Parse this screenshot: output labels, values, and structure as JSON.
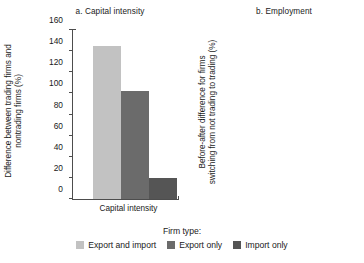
{
  "figure": {
    "legend_title": "Firm type:",
    "series_colors": {
      "export_and_import": "#c2c2c2",
      "export_only": "#6b6b6b",
      "import_only": "#555555"
    }
  },
  "chart_data": [
    {
      "type": "bar",
      "title": "a. Capital intensity",
      "categories": [
        "Capital intensity"
      ],
      "xlabel": "Capital intensity",
      "ylabel": "Difference between trading firms and nontrading firms (%)",
      "ylabel_line1": "Difference between trading firms and",
      "ylabel_line2": "nontrading firms (%)",
      "ylim": [
        0,
        160
      ],
      "yticks": [
        0,
        20,
        40,
        60,
        80,
        100,
        120,
        140,
        160
      ],
      "ytick_labels": [
        "0",
        "20",
        "40",
        "60",
        "80",
        "100",
        "120",
        "140",
        "160"
      ],
      "grid": false,
      "legend_position": "bottom",
      "series": [
        {
          "name": "Export and import",
          "values": [
            145
          ]
        },
        {
          "name": "Export only",
          "values": [
            102
          ]
        },
        {
          "name": "Import only",
          "values": [
            20
          ]
        }
      ]
    },
    {
      "type": "bar",
      "title": "b. Employment",
      "categories": [
        "Employment"
      ],
      "xlabel": "Employment",
      "ylabel": "Before-after difference for firms switching from not trading to trading (%)",
      "ylabel_line1": "Before-after difference for firms",
      "ylabel_line2": "switching from not trading to trading (%)",
      "ylim": [
        0,
        160
      ],
      "yticks": [
        0,
        20,
        40,
        60,
        80,
        100,
        120,
        140,
        160
      ],
      "ytick_labels": [
        "0",
        "20",
        "40",
        "60",
        "80",
        "100",
        "120",
        "140",
        "160"
      ],
      "grid": false,
      "legend_position": "bottom",
      "series": [
        {
          "name": "Export and import",
          "values": [
            38
          ]
        },
        {
          "name": "Export only",
          "values": [
            28
          ]
        },
        {
          "name": "Import only",
          "values": [
            6
          ]
        }
      ]
    }
  ]
}
